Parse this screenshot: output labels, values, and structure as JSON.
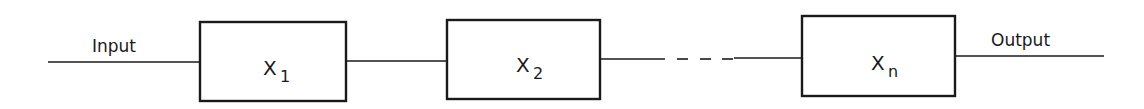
{
  "diagram": {
    "type": "series-block-chain",
    "input_label": "Input",
    "output_label": "Output",
    "blocks": [
      {
        "symbol": "X",
        "subscript": "1"
      },
      {
        "symbol": "X",
        "subscript": "2"
      },
      {
        "symbol": "X",
        "subscript": "n"
      }
    ],
    "ellipsis": "- - -",
    "colors": {
      "stroke": "#1a1a1a",
      "background": "#ffffff"
    }
  }
}
